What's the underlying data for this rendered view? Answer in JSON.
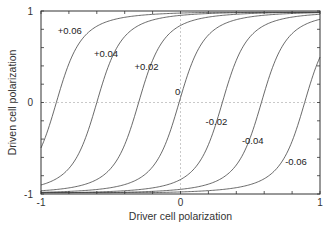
{
  "chart_data": {
    "type": "line",
    "title": "",
    "xlabel": "Driver cell polarization",
    "ylabel": "Driven cell polarization",
    "xlim": [
      -1,
      1
    ],
    "ylim": [
      -1,
      1
    ],
    "x_ticks": [
      "-1",
      "0",
      "1"
    ],
    "y_ticks": [
      "-1",
      "0",
      "1"
    ],
    "grid": "dashed zero lines only",
    "legend": "inline curve labels",
    "series": [
      {
        "name": "+0.06",
        "bias": 0.06,
        "zero_crossing_x": -0.89,
        "label_pos": [
          -0.88,
          0.75
        ]
      },
      {
        "name": "+0.04",
        "bias": 0.04,
        "zero_crossing_x": -0.6,
        "label_pos": [
          -0.62,
          0.5
        ]
      },
      {
        "name": "+0.02",
        "bias": 0.02,
        "zero_crossing_x": -0.3,
        "label_pos": [
          -0.33,
          0.35
        ]
      },
      {
        "name": "0",
        "bias": 0.0,
        "zero_crossing_x": -0.01,
        "label_pos": [
          -0.04,
          0.08
        ]
      },
      {
        "name": "-0.02",
        "bias": -0.02,
        "zero_crossing_x": 0.3,
        "label_pos": [
          0.18,
          -0.25
        ]
      },
      {
        "name": "-0.04",
        "bias": -0.04,
        "zero_crossing_x": 0.58,
        "label_pos": [
          0.44,
          -0.45
        ]
      },
      {
        "name": "-0.06",
        "bias": -0.06,
        "zero_crossing_x": 0.89,
        "label_pos": [
          0.75,
          -0.68
        ]
      }
    ]
  }
}
